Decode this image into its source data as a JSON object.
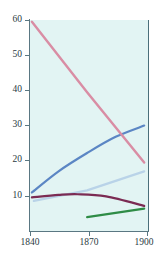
{
  "chart_data": {
    "type": "line",
    "title": "",
    "subtitle": "",
    "xlabel": "",
    "ylabel": "",
    "xlim": [
      1840,
      1902
    ],
    "ylim": [
      0,
      62
    ],
    "grid": false,
    "legend_position": "none",
    "x_ticks": [
      "1840",
      "1870",
      "1900"
    ],
    "x_tick_values": [
      1840,
      1870,
      1900
    ],
    "y_ticks": [
      "10",
      "20",
      "30",
      "40",
      "50",
      "60"
    ],
    "y_tick_values": [
      10,
      20,
      30,
      40,
      50,
      60
    ],
    "series": [
      {
        "name": "pink-declining-series",
        "color": "#d98da4",
        "x": [
          1841,
          1870,
          1900
        ],
        "values": [
          59.5,
          39.5,
          19.5
        ]
      },
      {
        "name": "blue-rising-series",
        "color": "#5b86c4",
        "x": [
          1841,
          1855,
          1870,
          1885,
          1900
        ],
        "values": [
          11.0,
          17.0,
          22.2,
          26.8,
          30.0
        ]
      },
      {
        "name": "light-blue-rising-series",
        "color": "#b9d3e8",
        "x": [
          1842,
          1870,
          1900
        ],
        "values": [
          8.6,
          11.6,
          17.0
        ]
      },
      {
        "name": "dark-red-flat-series",
        "color": "#7b2b53",
        "x": [
          1841,
          1855,
          1865,
          1880,
          1900
        ],
        "values": [
          9.6,
          10.3,
          10.5,
          9.9,
          7.2
        ]
      },
      {
        "name": "green-rising-series",
        "color": "#2e8c46",
        "x": [
          1870,
          1900
        ],
        "values": [
          4.0,
          6.4
        ]
      }
    ]
  },
  "axes": {
    "y_ticks": [
      {
        "label": "60",
        "value": 60
      },
      {
        "label": "50",
        "value": 50
      },
      {
        "label": "40",
        "value": 40
      },
      {
        "label": "30",
        "value": 30
      },
      {
        "label": "20",
        "value": 20
      },
      {
        "label": "10",
        "value": 10
      }
    ],
    "x_ticks": [
      {
        "label": "1840",
        "value": 1840
      },
      {
        "label": "1870",
        "value": 1870
      },
      {
        "label": "1900",
        "value": 1900
      }
    ]
  },
  "colors": {
    "plot_background": "#e2f4f3",
    "axis": "#5a7782",
    "tick_text": "#2a3a42",
    "page_background": "#ffffff"
  }
}
